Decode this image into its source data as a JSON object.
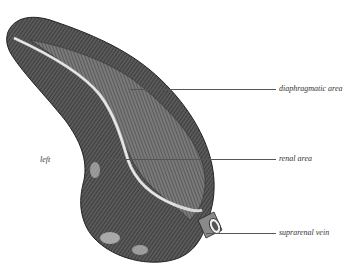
{
  "figure": {
    "labels": {
      "side": "left",
      "diaphragmatic": "diaphragmatic area",
      "renal": "renal area",
      "vein": "suprarenal vein"
    },
    "colors": {
      "background": "#ffffff",
      "ink_dark": "#2e2e2e",
      "ink_mid": "#6a6a6a",
      "ink_light": "#b8b8b8",
      "leader_line": "#555555"
    }
  }
}
